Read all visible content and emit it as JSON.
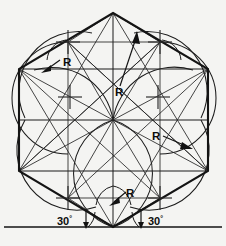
{
  "figure": {
    "type": "technical-line-drawing",
    "background_color": "#f4f4f2",
    "line_color": "#141414",
    "canvas": {
      "width": 226,
      "height": 246
    }
  },
  "geometry": {
    "hexagon": {
      "label": "regular-hexagon",
      "center": {
        "x": 113,
        "y": 120
      },
      "vertices": [
        {
          "name": "top",
          "x": 113,
          "y": 13
        },
        {
          "name": "upper-right",
          "x": 208,
          "y": 69
        },
        {
          "name": "lower-right",
          "x": 208,
          "y": 171
        },
        {
          "name": "bottom",
          "x": 113,
          "y": 227
        },
        {
          "name": "lower-left",
          "x": 19,
          "y": 171
        },
        {
          "name": "upper-left",
          "x": 19,
          "y": 69
        }
      ]
    },
    "center_marks": [
      {
        "name": "center-mark-upper-left",
        "x": 68,
        "y": 42
      },
      {
        "name": "center-mark-upper-right",
        "x": 160,
        "y": 42
      },
      {
        "name": "center-mark-inner-left",
        "x": 70,
        "y": 97
      },
      {
        "name": "center-mark-inner-right",
        "x": 158,
        "y": 97
      },
      {
        "name": "center-mark-lower-left",
        "x": 68,
        "y": 198
      },
      {
        "name": "center-mark-lower-right",
        "x": 160,
        "y": 198
      }
    ],
    "baseline": {
      "name": "ground-baseline",
      "y": 227,
      "x1": 4,
      "x2": 222
    }
  },
  "annotations": {
    "radius_labels": [
      {
        "id": "R1",
        "text": "R",
        "x": 63,
        "y": 62,
        "leader_to": {
          "x": 44,
          "y": 71
        }
      },
      {
        "id": "R2",
        "text": "R",
        "x": 118,
        "y": 93,
        "leader_to": {
          "x": 135,
          "y": 36
        }
      },
      {
        "id": "R3",
        "text": "R",
        "x": 155,
        "y": 137,
        "leader_to": {
          "x": 188,
          "y": 148
        }
      },
      {
        "id": "R4",
        "text": "R",
        "x": 129,
        "y": 194,
        "leader_to": {
          "x": 114,
          "y": 204
        }
      }
    ],
    "angle_labels": [
      {
        "id": "A-left",
        "value": "30",
        "symbol": "°",
        "x": 64,
        "y": 224
      },
      {
        "id": "A-right",
        "value": "30",
        "symbol": "°",
        "x": 155,
        "y": 224
      }
    ]
  }
}
